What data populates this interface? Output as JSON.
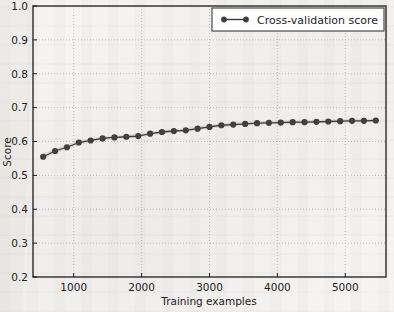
{
  "chart_data": {
    "type": "line",
    "title": "",
    "xlabel": "Training examples",
    "ylabel": "Score",
    "xlim": [
      400,
      5600
    ],
    "ylim": [
      0.2,
      1.0
    ],
    "xticks": [
      1000,
      2000,
      3000,
      4000,
      5000
    ],
    "xtick_labels": [
      "1000",
      "2000",
      "3000",
      "4000",
      "5000"
    ],
    "yticks": [
      0.2,
      0.3,
      0.4,
      0.5,
      0.6,
      0.7,
      0.8,
      0.9,
      1.0
    ],
    "ytick_labels": [
      "0.2",
      "0.3",
      "0.4",
      "0.5",
      "0.6",
      "0.7",
      "0.8",
      "0.9",
      "1.0"
    ],
    "grid": true,
    "grid_style": "dotted",
    "legend_position": "upper right",
    "legend": [
      "Cross-validation score"
    ],
    "series": [
      {
        "name": "Cross-validation score",
        "color": "#3b3b3b",
        "marker": "circle",
        "band_color": "#cccccc",
        "x": [
          550,
          725,
          900,
          1075,
          1250,
          1425,
          1600,
          1775,
          1950,
          2125,
          2300,
          2475,
          2650,
          2825,
          3000,
          3175,
          3350,
          3525,
          3700,
          3875,
          4050,
          4225,
          4400,
          4575,
          4750,
          4925,
          5100,
          5275,
          5450
        ],
        "values": [
          0.555,
          0.572,
          0.583,
          0.597,
          0.603,
          0.609,
          0.612,
          0.614,
          0.616,
          0.623,
          0.628,
          0.631,
          0.633,
          0.638,
          0.643,
          0.648,
          0.65,
          0.652,
          0.654,
          0.655,
          0.656,
          0.657,
          0.657,
          0.658,
          0.659,
          0.66,
          0.661,
          0.661,
          0.662
        ],
        "band_lower": [
          0.548,
          0.566,
          0.577,
          0.591,
          0.598,
          0.604,
          0.607,
          0.609,
          0.611,
          0.618,
          0.623,
          0.626,
          0.628,
          0.633,
          0.638,
          0.643,
          0.645,
          0.647,
          0.649,
          0.65,
          0.651,
          0.652,
          0.652,
          0.653,
          0.654,
          0.655,
          0.656,
          0.656,
          0.657
        ],
        "band_upper": [
          0.563,
          0.579,
          0.59,
          0.604,
          0.609,
          0.615,
          0.618,
          0.62,
          0.622,
          0.629,
          0.634,
          0.637,
          0.639,
          0.644,
          0.649,
          0.654,
          0.656,
          0.658,
          0.66,
          0.661,
          0.662,
          0.663,
          0.663,
          0.664,
          0.665,
          0.666,
          0.667,
          0.667,
          0.668
        ]
      }
    ]
  },
  "colors": {
    "line": "#3b3b3b",
    "marker": "#404040",
    "band": "#cfcfcf",
    "grid": "#b9b9b9",
    "axis": "#1c1c1c",
    "background": "#f5f4f2",
    "legend_face": "#ffffff",
    "legend_edge": "#4a4a4a"
  }
}
